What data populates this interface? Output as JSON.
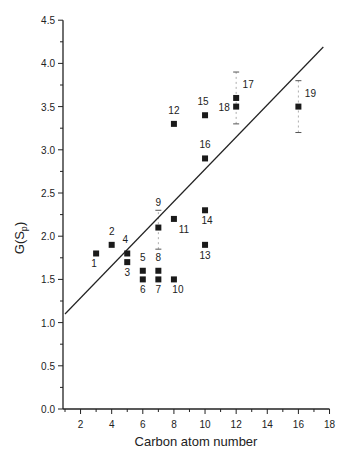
{
  "chart_data": {
    "type": "scatter",
    "title": "",
    "xlabel": "Carbon atom number",
    "ylabel": "G(S_p)",
    "xlim": [
      1,
      18
    ],
    "ylim": [
      0,
      4.5
    ],
    "x_ticks": [
      2,
      4,
      6,
      8,
      10,
      12,
      14,
      16,
      18
    ],
    "y_ticks": [
      "0.0",
      "0.5",
      "1.0",
      "1.5",
      "2.0",
      "2.5",
      "3.0",
      "3.5",
      "4.0",
      "4.5"
    ],
    "grid": false,
    "legend": null,
    "points": [
      {
        "label": "1",
        "x": 3,
        "y": 1.8,
        "lx": -2,
        "ly": 14
      },
      {
        "label": "2",
        "x": 4,
        "y": 1.9,
        "lx": 0,
        "ly": -10
      },
      {
        "label": "3",
        "x": 5,
        "y": 1.7,
        "lx": 0,
        "ly": 14
      },
      {
        "label": "4",
        "x": 5,
        "y": 1.8,
        "lx": -2,
        "ly": -10
      },
      {
        "label": "5",
        "x": 6,
        "y": 1.6,
        "lx": 0,
        "ly": -10
      },
      {
        "label": "6",
        "x": 6,
        "y": 1.5,
        "lx": 0,
        "ly": 14
      },
      {
        "label": "7",
        "x": 7,
        "y": 1.5,
        "lx": 0,
        "ly": 14
      },
      {
        "label": "8",
        "x": 7,
        "y": 1.6,
        "lx": 0,
        "ly": -10
      },
      {
        "label": "9",
        "x": 7,
        "y": 2.1,
        "lx": 0,
        "ly": -22
      },
      {
        "label": "10",
        "x": 8,
        "y": 1.5,
        "lx": 4,
        "ly": 14
      },
      {
        "label": "11",
        "x": 8,
        "y": 2.2,
        "lx": 10,
        "ly": 14
      },
      {
        "label": "12",
        "x": 8,
        "y": 3.3,
        "lx": 0,
        "ly": -10
      },
      {
        "label": "13",
        "x": 10,
        "y": 1.9,
        "lx": 0,
        "ly": 14
      },
      {
        "label": "14",
        "x": 10,
        "y": 2.3,
        "lx": 2,
        "ly": 14
      },
      {
        "label": "15",
        "x": 10,
        "y": 3.4,
        "lx": -2,
        "ly": -10
      },
      {
        "label": "16",
        "x": 10,
        "y": 2.9,
        "lx": 0,
        "ly": -10
      },
      {
        "label": "17",
        "x": 12,
        "y": 3.6,
        "lx": 12,
        "ly": -10
      },
      {
        "label": "18",
        "x": 12,
        "y": 3.5,
        "lx": -12,
        "ly": 4
      },
      {
        "label": "19",
        "x": 16,
        "y": 3.5,
        "lx": 12,
        "ly": -10
      }
    ],
    "error_bars": [
      {
        "x": 7,
        "low": 1.85,
        "high": 2.3
      },
      {
        "x": 12,
        "low": 3.3,
        "high": 3.9
      },
      {
        "x": 16,
        "low": 3.2,
        "high": 3.8
      }
    ],
    "fit_line": {
      "x0": 1,
      "y0": 1.1,
      "x1": 17.6,
      "y1": 4.19
    }
  }
}
